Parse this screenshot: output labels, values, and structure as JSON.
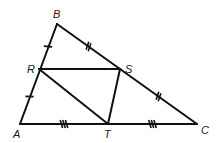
{
  "diagram": {
    "type": "geometry-triangle-midsegments",
    "vertices": [
      {
        "id": "A",
        "label": "A",
        "x": 20,
        "y": 124,
        "lx": 13,
        "ly": 138
      },
      {
        "id": "B",
        "label": "B",
        "x": 57,
        "y": 24,
        "lx": 53,
        "ly": 18
      },
      {
        "id": "C",
        "label": "C",
        "x": 197,
        "y": 124,
        "lx": 201,
        "ly": 134
      },
      {
        "id": "R",
        "label": "R",
        "x": 39,
        "y": 69,
        "lx": 27,
        "ly": 73
      },
      {
        "id": "S",
        "label": "S",
        "x": 120,
        "y": 69,
        "lx": 125,
        "ly": 73
      },
      {
        "id": "T",
        "label": "T",
        "x": 108,
        "y": 124,
        "lx": 104,
        "ly": 138
      }
    ],
    "segments": [
      [
        "A",
        "B"
      ],
      [
        "B",
        "C"
      ],
      [
        "A",
        "C"
      ],
      [
        "R",
        "S"
      ],
      [
        "S",
        "T"
      ],
      [
        "R",
        "T"
      ]
    ],
    "tick_marks": [
      {
        "segment": "B-R",
        "count": 1
      },
      {
        "segment": "R-A",
        "count": 1
      },
      {
        "segment": "B-S",
        "count": 2
      },
      {
        "segment": "S-C",
        "count": 2
      },
      {
        "segment": "A-T",
        "count": 3
      },
      {
        "segment": "T-C",
        "count": 3
      }
    ]
  }
}
